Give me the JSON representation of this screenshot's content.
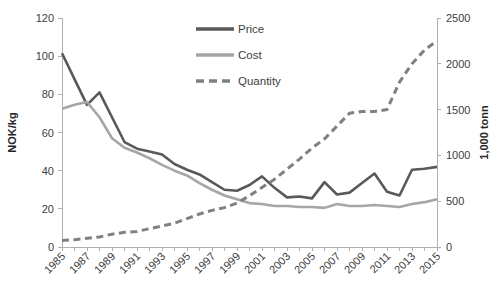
{
  "chart_data": {
    "type": "line",
    "title": "",
    "xlabel": "",
    "ylabel": "NOK/kg",
    "y2label": "1,000 tonn",
    "ylim": [
      0,
      120
    ],
    "y2lim": [
      0,
      2500
    ],
    "yticks": [
      0,
      20,
      40,
      60,
      80,
      100,
      120
    ],
    "y2ticks": [
      0,
      500,
      1000,
      1500,
      2000,
      2500
    ],
    "grid": false,
    "legend_position": "top-center",
    "x": [
      1985,
      1986,
      1987,
      1988,
      1989,
      1990,
      1991,
      1992,
      1993,
      1994,
      1995,
      1996,
      1997,
      1998,
      1999,
      2000,
      2001,
      2002,
      2003,
      2004,
      2005,
      2006,
      2007,
      2008,
      2009,
      2010,
      2011,
      2012,
      2013,
      2014,
      2015
    ],
    "xtick_labels": [
      "1985",
      "1987",
      "1989",
      "1991",
      "1993",
      "1995",
      "1997",
      "1999",
      "2001",
      "2003",
      "2005",
      "2007",
      "2009",
      "2011",
      "2013",
      "2015"
    ],
    "series": [
      {
        "name": "Price",
        "axis": "left",
        "style": "solid",
        "color": "#595959",
        "values": [
          101.5,
          88.0,
          74.5,
          81.0,
          68.0,
          55.0,
          51.5,
          50.0,
          48.5,
          43.5,
          40.5,
          38.0,
          34.0,
          30.0,
          29.5,
          32.5,
          37.0,
          31.0,
          26.0,
          26.5,
          25.5,
          34.0,
          27.5,
          28.5,
          33.5,
          38.5,
          29.0,
          27.0,
          40.5,
          41.0,
          42.0
        ]
      },
      {
        "name": "Cost",
        "axis": "left",
        "style": "solid",
        "color": "#a6a6a6",
        "values": [
          72.5,
          74.5,
          76.0,
          68.0,
          57.0,
          52.0,
          49.5,
          46.5,
          43.0,
          40.0,
          37.5,
          33.5,
          30.0,
          27.0,
          25.0,
          23.0,
          22.5,
          21.5,
          21.5,
          21.0,
          21.0,
          20.5,
          22.5,
          21.5,
          21.5,
          22.0,
          21.5,
          21.0,
          22.5,
          23.5,
          25.0
        ]
      },
      {
        "name": "Quantity",
        "axis": "right",
        "style": "dashed",
        "color": "#808080",
        "values": [
          70,
          80,
          95,
          110,
          140,
          160,
          170,
          200,
          230,
          260,
          310,
          360,
          400,
          430,
          480,
          560,
          650,
          740,
          850,
          960,
          1080,
          1180,
          1320,
          1460,
          1480,
          1480,
          1500,
          1800,
          2000,
          2150,
          2250
        ]
      }
    ]
  },
  "legend": {
    "items": [
      {
        "label": "Price"
      },
      {
        "label": "Cost"
      },
      {
        "label": "Quantity"
      }
    ]
  },
  "axes": {
    "left_title": "NOK/kg",
    "right_title": "1,000 tonn"
  }
}
